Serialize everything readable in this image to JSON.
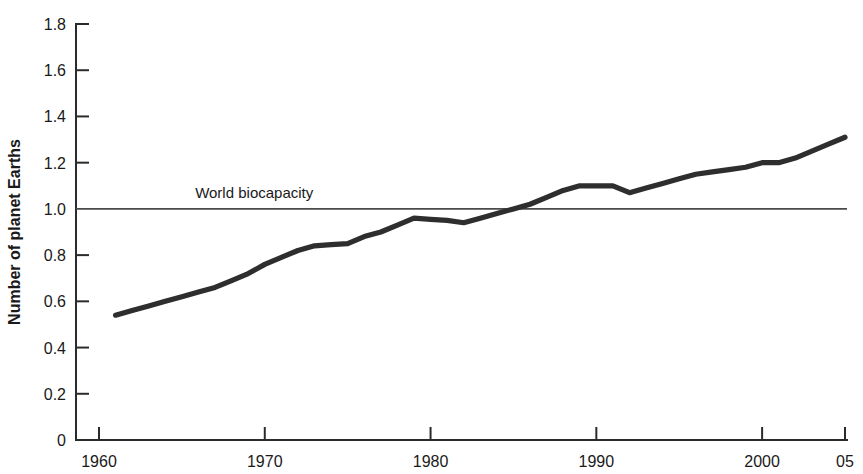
{
  "chart_data": {
    "type": "line",
    "title": "",
    "subtitle": "",
    "xlabel": "",
    "ylabel": "Number of planet Earths",
    "xlim": [
      1960,
      2005
    ],
    "ylim": [
      0,
      1.8
    ],
    "grid": false,
    "legend_position": "none",
    "x_tick_labels": [
      "1960",
      "1970",
      "1980",
      "1990",
      "2000",
      "05"
    ],
    "x_tick_values": [
      1960,
      1970,
      1980,
      1990,
      2000,
      2005
    ],
    "y_tick_labels": [
      "0",
      "0.2",
      "0.4",
      "0.6",
      "0.8",
      "1.0",
      "1.2",
      "1.4",
      "1.6",
      "1.8"
    ],
    "y_tick_values": [
      0,
      0.2,
      0.4,
      0.6,
      0.8,
      1.0,
      1.2,
      1.4,
      1.6,
      1.8
    ],
    "annotations": [
      {
        "name": "world-biocapacity",
        "text": "World biocapacity",
        "type": "hline",
        "y": 1.0,
        "label_x": 1965.8,
        "label_y": 1.045,
        "color": "#4a4a4a"
      }
    ],
    "series": [
      {
        "name": "Humanity's ecological footprint",
        "color": "#2e2e2e",
        "x": [
          1961,
          1962,
          1963,
          1964,
          1965,
          1966,
          1967,
          1968,
          1969,
          1970,
          1971,
          1972,
          1973,
          1974,
          1975,
          1976,
          1977,
          1978,
          1979,
          1980,
          1981,
          1982,
          1983,
          1984,
          1985,
          1986,
          1987,
          1988,
          1989,
          1990,
          1991,
          1992,
          1993,
          1994,
          1995,
          1996,
          1997,
          1998,
          1999,
          2000,
          2001,
          2002,
          2003,
          2004,
          2005
        ],
        "y": [
          0.54,
          0.56,
          0.58,
          0.6,
          0.62,
          0.64,
          0.66,
          0.69,
          0.72,
          0.76,
          0.79,
          0.82,
          0.84,
          0.845,
          0.85,
          0.88,
          0.9,
          0.93,
          0.96,
          0.955,
          0.95,
          0.94,
          0.96,
          0.98,
          1.0,
          1.02,
          1.05,
          1.08,
          1.1,
          1.1,
          1.1,
          1.07,
          1.09,
          1.11,
          1.13,
          1.15,
          1.16,
          1.17,
          1.18,
          1.2,
          1.2,
          1.22,
          1.25,
          1.28,
          1.31
        ]
      }
    ]
  },
  "colors": {
    "series": "#2e2e2e",
    "reference": "#4a4a4a",
    "axis": "#2b2b2b",
    "background": "#ffffff"
  }
}
